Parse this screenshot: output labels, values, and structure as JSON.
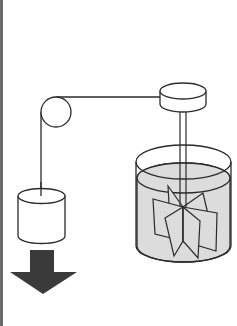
{
  "diagram": {
    "title": "Joule apparatus: falling weight drives paddle wheel in water",
    "colors": {
      "stroke": "#2a2a2a",
      "water": "#dcdcdc",
      "arrow": "#3a3a3a",
      "border": "#6a6a6a",
      "background": "#ffffff"
    },
    "components": [
      {
        "id": "pulley",
        "label": "pulley"
      },
      {
        "id": "rope",
        "label": "rope"
      },
      {
        "id": "weight",
        "label": "falling weight"
      },
      {
        "id": "arrow",
        "label": "downward motion arrow"
      },
      {
        "id": "drum",
        "label": "drum"
      },
      {
        "id": "shaft",
        "label": "shaft"
      },
      {
        "id": "container",
        "label": "water container"
      },
      {
        "id": "water",
        "label": "water"
      },
      {
        "id": "paddle-wheel",
        "label": "paddle wheel"
      }
    ]
  }
}
